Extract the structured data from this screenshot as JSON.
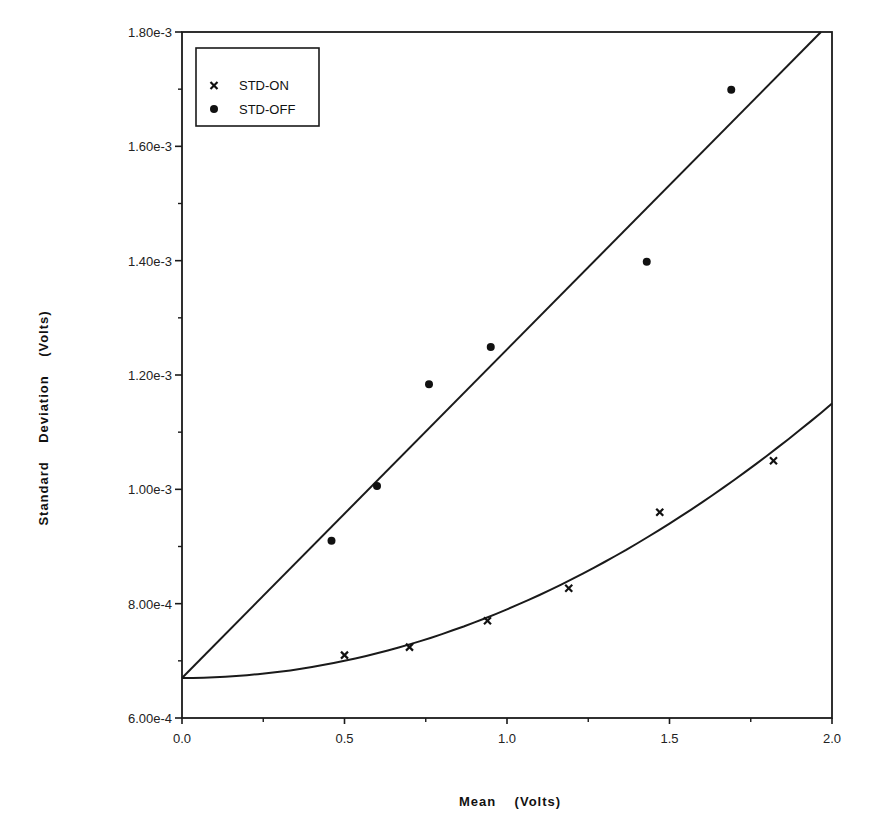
{
  "chart_data": {
    "type": "scatter",
    "title": "",
    "xlabel": "Mean    (Volts)",
    "ylabel": "Standard    Deviation    (Volts)",
    "xlim": [
      0.0,
      2.0
    ],
    "ylim": [
      0.0006,
      0.0018
    ],
    "grid": false,
    "legend_position": "upper-left",
    "x_ticks": [
      0.0,
      0.5,
      1.0,
      1.5,
      2.0
    ],
    "x_tick_labels": [
      "0.0",
      "0.5",
      "1.0",
      "1.5",
      "2.0"
    ],
    "x_minor_ticks": [
      0.25,
      0.75,
      1.25,
      1.75
    ],
    "y_ticks": [
      0.0006,
      0.0008,
      0.001,
      0.0012,
      0.0014,
      0.0016,
      0.0018
    ],
    "y_tick_labels": [
      "6.00e-4",
      "8.00e-4",
      "1.00e-3",
      "1.20e-3",
      "1.40e-3",
      "1.60e-3",
      "1.80e-3"
    ],
    "y_minor_ticks": [
      0.0007,
      0.0009,
      0.0011,
      0.0013,
      0.0015,
      0.0017
    ],
    "series": [
      {
        "name": "STD-ON",
        "marker": "x",
        "x": [
          0.5,
          0.7,
          0.94,
          1.19,
          1.47,
          1.82
        ],
        "y": [
          0.00071,
          0.000724,
          0.00077,
          0.000827,
          0.00096,
          0.00105
        ],
        "fit": {
          "type": "quadratic",
          "x": [
            0.0,
            2.0
          ],
          "y_intercept": 0.00067,
          "coeff_x2": 0.00012,
          "y_end": 0.00115
        }
      },
      {
        "name": "STD-OFF",
        "marker": "filled-circle",
        "x": [
          0.46,
          0.6,
          0.76,
          0.95,
          1.43,
          1.69
        ],
        "y": [
          0.00091,
          0.001006,
          0.001184,
          0.001249,
          0.001398,
          0.001699
        ],
        "fit": {
          "type": "linear",
          "x": [
            0.0,
            1.966
          ],
          "y": [
            0.00067,
            0.0018
          ]
        }
      }
    ]
  },
  "legend": {
    "items": [
      {
        "label": "STD-ON",
        "marker": "x-mark-icon"
      },
      {
        "label": "STD-OFF",
        "marker": "filled-circle-icon"
      }
    ]
  },
  "colors": {
    "ink": "#1a1a1a",
    "background": "#ffffff"
  }
}
